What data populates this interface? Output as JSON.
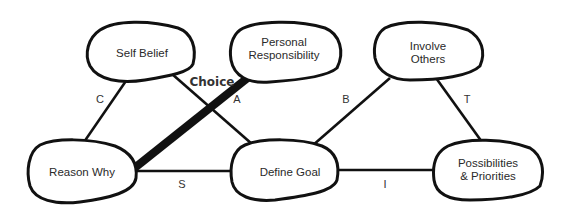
{
  "diagram": {
    "nodes": [
      {
        "id": "self-belief",
        "lines": [
          "Self Belief"
        ]
      },
      {
        "id": "personal-responsibility",
        "lines": [
          "Personal",
          "Responsibility"
        ]
      },
      {
        "id": "involve-others",
        "lines": [
          "Involve",
          "Others"
        ]
      },
      {
        "id": "reason-why",
        "lines": [
          "Reason Why"
        ]
      },
      {
        "id": "define-goal",
        "lines": [
          "Define Goal"
        ]
      },
      {
        "id": "possibilities-priorities",
        "lines": [
          "Possibilities",
          "& Priorities"
        ]
      }
    ],
    "edges": [
      {
        "from": "self-belief",
        "to": "reason-why",
        "label": "C"
      },
      {
        "from": "self-belief",
        "to": "define-goal",
        "label": "A"
      },
      {
        "from": "reason-why",
        "to": "personal-responsibility",
        "label": "Choice",
        "emphasis": "thick"
      },
      {
        "from": "reason-why",
        "to": "define-goal",
        "label": "S"
      },
      {
        "from": "define-goal",
        "to": "involve-others",
        "label": "B"
      },
      {
        "from": "involve-others",
        "to": "possibilities-priorities",
        "label": "T"
      },
      {
        "from": "define-goal",
        "to": "possibilities-priorities",
        "label": "I"
      }
    ]
  }
}
